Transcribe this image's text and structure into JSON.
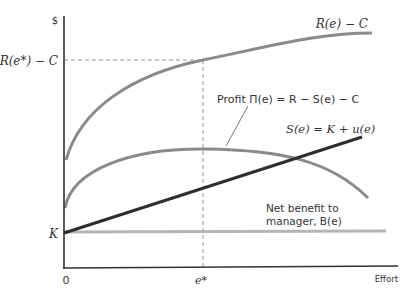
{
  "diagram": {
    "y_axis_label": "$",
    "x_axis_label": "Effort",
    "origin_label": "0",
    "y_tick_k": "K",
    "y_tick_rec": "R(e*) − C",
    "x_tick_estar": "e*",
    "curve_revenue_label": "R(e) − C",
    "curve_profit_label": "Profit Π(e) = R − S(e) − C",
    "curve_salary_label": "S(e) = K + u(e)",
    "curve_benefit_label_line1": "Net benefit to",
    "curve_benefit_label_line2": "manager, B(e)"
  },
  "colors": {
    "axis": "#333333",
    "revenue_curve": "#8a8a8a",
    "profit_curve": "#8a8a8a",
    "salary_line": "#2e2e2e",
    "benefit_line": "#b5b5b5",
    "dashed": "#777777"
  }
}
